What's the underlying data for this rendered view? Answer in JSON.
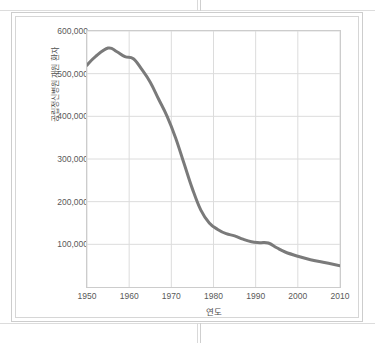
{
  "chart_data": {
    "type": "line",
    "title": "",
    "xlabel": "연도",
    "ylabel": "공립정신병원 재원 환자",
    "xlim": [
      1950,
      2010
    ],
    "ylim": [
      0,
      600000
    ],
    "grid": true,
    "legend": false,
    "line_color": "#7a7a7a",
    "grid_color": "#dcdcdc",
    "axis_color": "#cccccc",
    "x_ticks": [
      "1950",
      "1960",
      "1970",
      "1980",
      "1990",
      "2000",
      "2010"
    ],
    "x_tick_values": [
      1950,
      1960,
      1970,
      1980,
      1990,
      2000,
      2010
    ],
    "y_ticks": [
      "100,000",
      "200,000",
      "300,000",
      "400,000",
      "500,000",
      "600,000"
    ],
    "y_tick_values": [
      100000,
      200000,
      300000,
      400000,
      500000,
      600000
    ],
    "x": [
      1950,
      1952,
      1955,
      1957,
      1959,
      1961,
      1963,
      1965,
      1967,
      1969,
      1971,
      1973,
      1975,
      1977,
      1979,
      1981,
      1983,
      1985,
      1987,
      1989,
      1991,
      1993,
      1995,
      1997,
      2000,
      2003,
      2006,
      2010
    ],
    "values": [
      520000,
      540000,
      560000,
      552000,
      540000,
      535000,
      510000,
      480000,
      440000,
      400000,
      350000,
      290000,
      230000,
      180000,
      150000,
      135000,
      125000,
      120000,
      112000,
      106000,
      104000,
      103000,
      92000,
      82000,
      72000,
      64000,
      58000,
      50000
    ],
    "series": [
      {
        "name": "공립정신병원 재원 환자",
        "values": [
          520000,
          540000,
          560000,
          552000,
          540000,
          535000,
          510000,
          480000,
          440000,
          400000,
          350000,
          290000,
          230000,
          180000,
          150000,
          135000,
          125000,
          120000,
          112000,
          106000,
          104000,
          103000,
          92000,
          82000,
          72000,
          64000,
          58000,
          50000
        ]
      }
    ]
  }
}
